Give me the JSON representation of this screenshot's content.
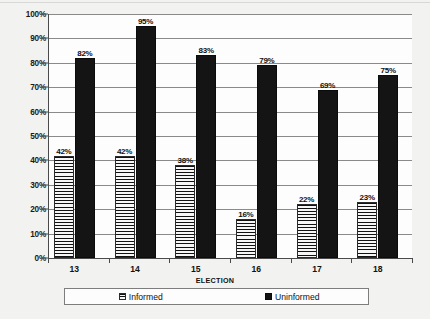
{
  "chart_data": {
    "type": "bar",
    "title": "",
    "xlabel": "ELECTION",
    "ylabel": "",
    "categories": [
      "13",
      "14",
      "15",
      "16",
      "17",
      "18"
    ],
    "series": [
      {
        "name": "Informed",
        "values": [
          42,
          42,
          38,
          16,
          22,
          23
        ],
        "labels": [
          "42%",
          "42%",
          "38%",
          "16%",
          "22%",
          "23%"
        ],
        "color": "#f4f4f4"
      },
      {
        "name": "Uninformed",
        "values": [
          82,
          95,
          83,
          79,
          69,
          75
        ],
        "labels": [
          "82%",
          "95%",
          "83%",
          "79%",
          "69%",
          "75%"
        ],
        "color": "#141414"
      }
    ],
    "ylim": [
      0,
      100
    ],
    "ytick_labels": [
      "100%",
      "90%",
      "80%",
      "70%",
      "60%",
      "50%",
      "40%",
      "30%",
      "20%",
      "10%",
      "0%"
    ],
    "ytick_values": [
      100,
      90,
      80,
      70,
      60,
      50,
      40,
      30,
      20,
      10,
      0
    ],
    "grid": true,
    "legend_position": "bottom"
  },
  "legend": {
    "items": [
      {
        "label": "Informed"
      },
      {
        "label": "Uninformed"
      }
    ]
  }
}
